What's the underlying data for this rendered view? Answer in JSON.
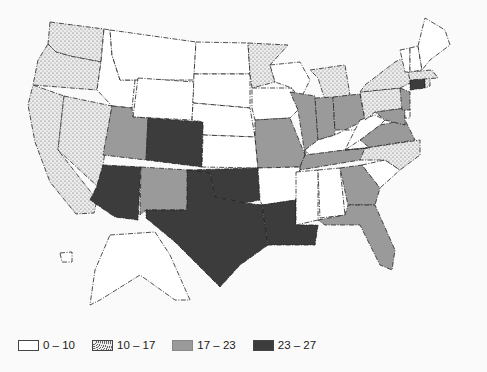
{
  "map": {
    "type": "choropleth",
    "region": "United States",
    "classes": [
      {
        "id": "c1",
        "label": "0 – 10",
        "fill": "#ffffff",
        "pattern": "none"
      },
      {
        "id": "c2",
        "label": "10 – 17",
        "fill": "#e6e6e6",
        "pattern": "stipple"
      },
      {
        "id": "c3",
        "label": "17 – 23",
        "fill": "#9a9a9a",
        "pattern": "none"
      },
      {
        "id": "c4",
        "label": "23 – 27",
        "fill": "#3c3c3c",
        "pattern": "none"
      }
    ],
    "states": {
      "WA": "c2",
      "OR": "c2",
      "CA": "c2",
      "NV": "c2",
      "ID": "c1",
      "MT": "c1",
      "WY": "c1",
      "UT": "c3",
      "CO": "c4",
      "AZ": "c4",
      "NM": "c3",
      "ND": "c1",
      "SD": "c1",
      "NE": "c1",
      "KS": "c1",
      "OK": "c4",
      "TX": "c4",
      "MN": "c2",
      "IA": "c1",
      "MO": "c3",
      "AR": "c1",
      "LA": "c4",
      "WI": "c1",
      "IL": "c3",
      "MI": "c2",
      "IN": "c3",
      "OH": "c3",
      "KY": "c1",
      "TN": "c3",
      "MS": "c1",
      "AL": "c1",
      "GA": "c3",
      "FL": "c3",
      "SC": "c1",
      "NC": "c2",
      "VA": "c3",
      "WV": "c1",
      "MD": "c3",
      "DE": "c1",
      "PA": "c2",
      "NJ": "c3",
      "NY": "c2",
      "CT": "c4",
      "RI": "c2",
      "MA": "c2",
      "VT": "c1",
      "NH": "c1",
      "ME": "c1",
      "AK": "c1",
      "HI": "c1"
    }
  },
  "legend": {
    "items": [
      {
        "label": "0 – 10"
      },
      {
        "label": "10 – 17"
      },
      {
        "label": "17 – 23"
      },
      {
        "label": "23 – 27"
      }
    ]
  }
}
